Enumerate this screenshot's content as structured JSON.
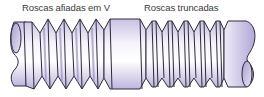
{
  "labels": {
    "v_threads": "Roscas afiadas em V",
    "truncated_threads": "Roscas truncadas"
  },
  "colors": {
    "body_light": "#f4f2fa",
    "body_mid": "#cfc8e6",
    "body_dark": "#a79bcd",
    "outline": "#2e2a3a",
    "label_text": "#3a3a3a"
  }
}
